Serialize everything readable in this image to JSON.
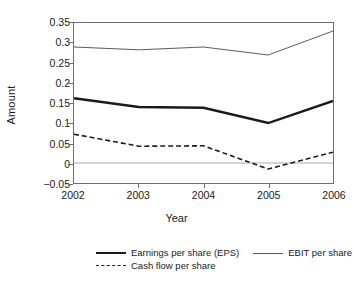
{
  "chart_data": {
    "type": "line",
    "title": "",
    "xlabel": "Year",
    "ylabel": "Amount",
    "categories": [
      "2002",
      "2003",
      "2004",
      "2005",
      "2006"
    ],
    "x": [
      2002,
      2003,
      2004,
      2005,
      2006
    ],
    "xlim": [
      2002,
      2006
    ],
    "ylim": [
      -0.05,
      0.35
    ],
    "yticks": [
      "0.35",
      "0.3",
      "0.25",
      "0.2",
      "0.15",
      "0.1",
      "0.05",
      "0",
      "-0.05"
    ],
    "ytick_values": [
      0.35,
      0.3,
      0.25,
      0.2,
      0.15,
      0.1,
      0.05,
      0,
      -0.05
    ],
    "grid": false,
    "zero_line": true,
    "zero_line_color": "#aaaaaa",
    "legend_position": "bottom",
    "series": [
      {
        "name": "Earnings per share (EPS)",
        "style": "thick-solid",
        "color": "#1a1a1a",
        "values": [
          0.162,
          0.14,
          0.138,
          0.1,
          0.155
        ]
      },
      {
        "name": "EBIT per share",
        "style": "thin-solid",
        "color": "#5a5a5a",
        "values": [
          0.29,
          0.283,
          0.29,
          0.27,
          0.33
        ]
      },
      {
        "name": "Cash flow per share",
        "style": "dashed",
        "color": "#1a1a1a",
        "values": [
          0.072,
          0.042,
          0.043,
          -0.015,
          0.027
        ]
      }
    ]
  },
  "axes": {
    "y_title": "Amount",
    "x_title": "Year",
    "frame_color": "#6e6e6e"
  },
  "legend": {
    "row1": [
      {
        "label": "Earnings per share (EPS)",
        "style": "thick-solid"
      },
      {
        "label": "EBIT per share",
        "style": "thin-solid"
      }
    ],
    "row2": [
      {
        "label": "Cash flow per share",
        "style": "dashed"
      }
    ]
  }
}
